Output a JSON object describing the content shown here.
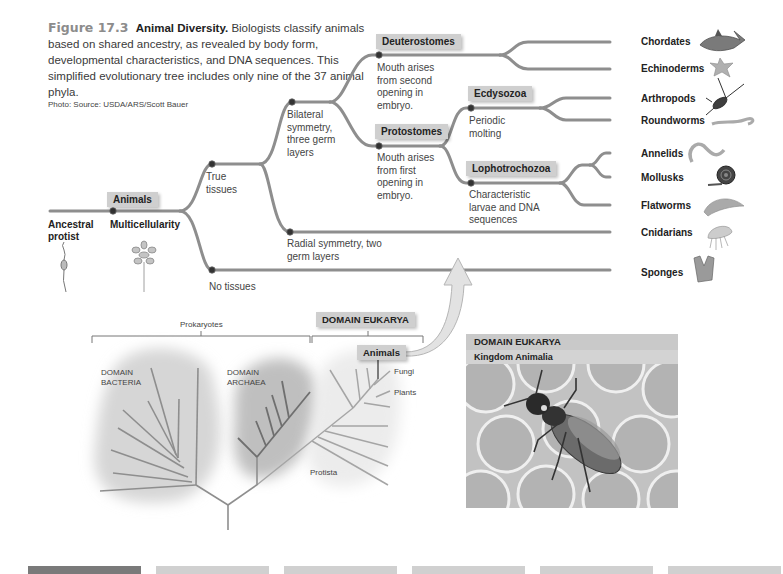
{
  "caption": {
    "figure_number": "Figure 17.3",
    "title": "Animal Diversity.",
    "text": "Biologists classify animals based on shared ancestry, as revealed by body form, developmental characteristics, and DNA sequences. This simplified evolutionary tree includes only nine of the 37 animal phyla.",
    "credit": "Photo: Source: USDA/ARS/Scott Bauer"
  },
  "tree": {
    "root_label": "Ancestral protist",
    "animals_tag": "Animals",
    "multicellularity": "Multicellularity",
    "true_tissues": "True tissues",
    "no_tissues": "No tissues",
    "bilateral": "Bilateral symmetry, three germ layers",
    "radial": "Radial symmetry, two germ layers",
    "deuterostomes_tag": "Deuterostomes",
    "deuterostomes_note": "Mouth arises from second opening in embryo.",
    "protostomes_tag": "Protostomes",
    "protostomes_note": "Mouth arises from first opening in embryo.",
    "ecdysozoa_tag": "Ecdysozoa",
    "ecdysozoa_note": "Periodic molting",
    "lophotrochozoa_tag": "Lophotrochozoa",
    "lophotrochozoa_note": "Characteristic larvae and DNA sequences",
    "phyla": [
      "Chordates",
      "Echinoderms",
      "Arthropods",
      "Roundworms",
      "Annelids",
      "Mollusks",
      "Flatworms",
      "Cnidarians",
      "Sponges"
    ]
  },
  "icons": {
    "chordates": "shark-icon",
    "echinoderms": "starfish-icon",
    "arthropods": "lobster-icon",
    "roundworms": "worm-icon",
    "annelids": "earthworm-icon",
    "mollusks": "snail-icon",
    "flatworms": "flatworm-icon",
    "cnidarians": "jellyfish-icon",
    "sponges": "sponge-icon"
  },
  "life_tree": {
    "prokaryotes": "Prokaryotes",
    "eukarya_tag": "DOMAIN EUKARYA",
    "bacteria": "DOMAIN BACTERIA",
    "archaea": "DOMAIN ARCHAEA",
    "animals_tag": "Animals",
    "fungi": "Fungi",
    "plants": "Plants",
    "protista": "Protista"
  },
  "photo": {
    "header": "DOMAIN EUKARYA",
    "subheader": "Kingdom Animalia"
  },
  "colors": {
    "line": "#8e8e8e",
    "tag_bg": "#cfcfcf",
    "bar_dark": "#7a7a7a",
    "bar_light": "#d0d0d0"
  }
}
